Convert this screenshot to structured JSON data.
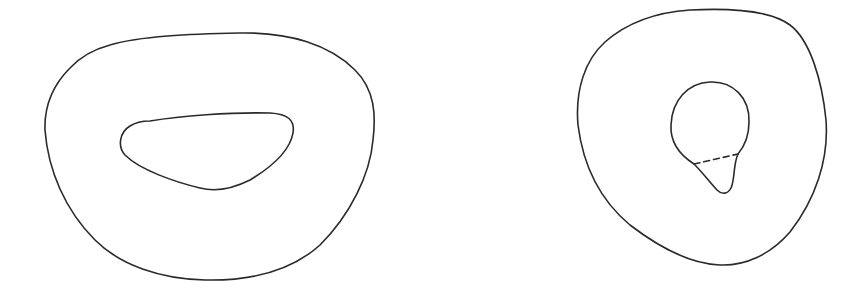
{
  "diagram": {
    "background": "#ffffff",
    "stroke_color": "#2a2a2a",
    "stroke_width": 1.6,
    "figures": [
      {
        "name": "annulus-with-oblong-hole",
        "outer_boundary": "closed rounded triangular-oval curve",
        "inner_boundary": "oblong rounded hole"
      },
      {
        "name": "annulus-with-teardrop-hole",
        "outer_boundary": "closed rounded triangular curve",
        "inner_boundary": "circular hole with teardrop appendage",
        "dashed_segment": "dashed line separating circle from teardrop tip"
      }
    ]
  }
}
